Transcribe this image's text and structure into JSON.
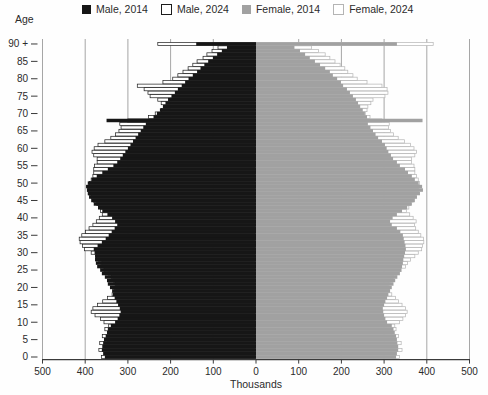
{
  "legend": {
    "items": [
      {
        "label": "Male, 2014",
        "swatch": "solid-black"
      },
      {
        "label": "Male, 2024",
        "swatch": "outline-black"
      },
      {
        "label": "Female, 2014",
        "swatch": "solid-gray"
      },
      {
        "label": "Female, 2024",
        "swatch": "outline-gray"
      }
    ]
  },
  "axes": {
    "y_title": "Age",
    "x_title": "Thousands",
    "x_tick_labels": [
      "500",
      "400",
      "300",
      "200",
      "100",
      "0",
      "100",
      "200",
      "300",
      "400",
      "500"
    ],
    "x_tick_values": [
      -500,
      -400,
      -300,
      -200,
      -100,
      0,
      100,
      200,
      300,
      400,
      500
    ],
    "y_tick_step": 5,
    "y_top_label": "90 +"
  },
  "colors": {
    "male_2014": "#161616",
    "male_2024_stroke": "#1c1c1c",
    "female_2014": "#a1a1a1",
    "female_2024_stroke": "#b4b4b4",
    "fill_2024": "#ffffff",
    "grid": "#8f8f8f",
    "axis": "#3a3a3a",
    "text": "#2b2b2b"
  },
  "chart_data": {
    "type": "bar",
    "subtype": "population-pyramid",
    "unit": "thousands",
    "age_min": 0,
    "age_max_label": "90 +",
    "value_axis": {
      "max": 500,
      "gridline_step": 100
    },
    "grid": "on",
    "legend_position": "top",
    "ages_note": "index 0..89 = single year of age, index 90 = aggregated 90+",
    "series": [
      {
        "name": "Male, 2014",
        "side": "left",
        "style": "solid",
        "values": [
          354,
          358,
          361,
          360,
          358,
          356,
          352,
          349,
          347,
          340,
          330,
          324,
          320,
          317,
          319,
          323,
          327,
          331,
          335,
          337,
          342,
          347,
          349,
          354,
          361,
          365,
          372,
          375,
          377,
          377,
          378,
          380,
          371,
          361,
          352,
          345,
          338,
          331,
          325,
          330,
          337,
          348,
          360,
          370,
          380,
          386,
          391,
          394,
          396,
          398,
          394,
          385,
          373,
          360,
          347,
          334,
          325,
          318,
          312,
          306,
          300,
          294,
          288,
          282,
          276,
          270,
          264,
          258,
          350,
          240,
          232,
          225,
          218,
          212,
          206,
          198,
          190,
          183,
          174,
          166,
          158,
          148,
          138,
          130,
          121,
          112,
          101,
          91,
          80,
          68,
          140
        ]
      },
      {
        "name": "Male, 2024",
        "side": "left",
        "style": "outline",
        "values": [
          362,
          351,
          368,
          352,
          366,
          348,
          360,
          344,
          354,
          345,
          356,
          364,
          377,
          386,
          382,
          371,
          359,
          348,
          337,
          331,
          328,
          330,
          334,
          339,
          346,
          356,
          364,
          361,
          369,
          374,
          386,
          402,
          406,
          412,
          414,
          408,
          399,
          391,
          382,
          374,
          367,
          360,
          364,
          369,
          373,
          381,
          386,
          391,
          394,
          393,
          390,
          386,
          382,
          380,
          380,
          378,
          372,
          372,
          380,
          384,
          379,
          370,
          354,
          340,
          329,
          321,
          316,
          319,
          300,
          252,
          236,
          222,
          215,
          222,
          230,
          248,
          253,
          262,
          278,
          218,
          195,
          183,
          171,
          159,
          148,
          138,
          124,
          115,
          103,
          89,
          230
        ]
      },
      {
        "name": "Female, 2014",
        "side": "right",
        "style": "solid",
        "values": [
          328,
          330,
          333,
          333,
          331,
          330,
          328,
          325,
          322,
          318,
          307,
          303,
          300,
          298,
          297,
          300,
          303,
          307,
          310,
          314,
          318,
          322,
          326,
          331,
          337,
          340,
          342,
          344,
          345,
          347,
          349,
          351,
          350,
          348,
          346,
          344,
          338,
          330,
          318,
          314,
          320,
          330,
          342,
          354,
          365,
          372,
          377,
          384,
          391,
          389,
          381,
          372,
          365,
          356,
          349,
          337,
          330,
          321,
          316,
          310,
          306,
          302,
          295,
          286,
          280,
          274,
          268,
          262,
          390,
          260,
          255,
          250,
          244,
          239,
          234,
          227,
          220,
          213,
          204,
          199,
          190,
          180,
          173,
          162,
          150,
          138,
          126,
          115,
          103,
          90,
          330
        ]
      },
      {
        "name": "Female, 2024",
        "side": "right",
        "style": "outline",
        "values": [
          336,
          326,
          342,
          328,
          340,
          324,
          334,
          318,
          328,
          325,
          336,
          344,
          350,
          354,
          350,
          342,
          334,
          327,
          318,
          312,
          310,
          312,
          316,
          322,
          330,
          340,
          350,
          355,
          362,
          372,
          380,
          388,
          390,
          393,
          392,
          386,
          380,
          374,
          371,
          375,
          368,
          360,
          352,
          358,
          362,
          368,
          372,
          376,
          380,
          382,
          383,
          380,
          376,
          372,
          372,
          370,
          364,
          364,
          372,
          376,
          370,
          362,
          348,
          333,
          322,
          315,
          310,
          312,
          295,
          267,
          256,
          260,
          262,
          269,
          274,
          302,
          309,
          307,
          295,
          260,
          237,
          227,
          215,
          208,
          197,
          185,
          173,
          162,
          146,
          130,
          415
        ]
      }
    ]
  }
}
